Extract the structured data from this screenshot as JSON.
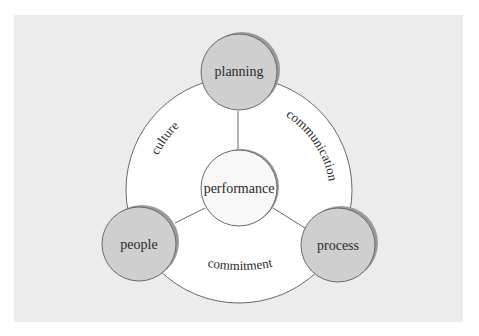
{
  "diagram": {
    "type": "hub-and-spoke cycle",
    "center": {
      "label": "performance"
    },
    "nodes": [
      {
        "id": "planning",
        "label": "planning",
        "position": "top"
      },
      {
        "id": "people",
        "label": "people",
        "position": "bottom-left"
      },
      {
        "id": "process",
        "label": "process",
        "position": "bottom-right"
      }
    ],
    "ring_labels": [
      {
        "label": "culture",
        "between": [
          "planning",
          "people"
        ]
      },
      {
        "label": "communication",
        "between": [
          "planning",
          "process"
        ]
      },
      {
        "label": "commitment",
        "between": [
          "people",
          "process"
        ]
      }
    ],
    "edges": [
      [
        "performance",
        "planning"
      ],
      [
        "performance",
        "people"
      ],
      [
        "performance",
        "process"
      ]
    ]
  },
  "colors": {
    "page_bg": "#ffffff",
    "panel_bg": "#ececec",
    "ring_fill": "#ffffff",
    "node_fill": "#cfcfcf",
    "center_fill": "#f8f8f8",
    "stroke": "#6a6a6a",
    "shadow": "#9a9a9a",
    "text": "#2a2a2a"
  }
}
